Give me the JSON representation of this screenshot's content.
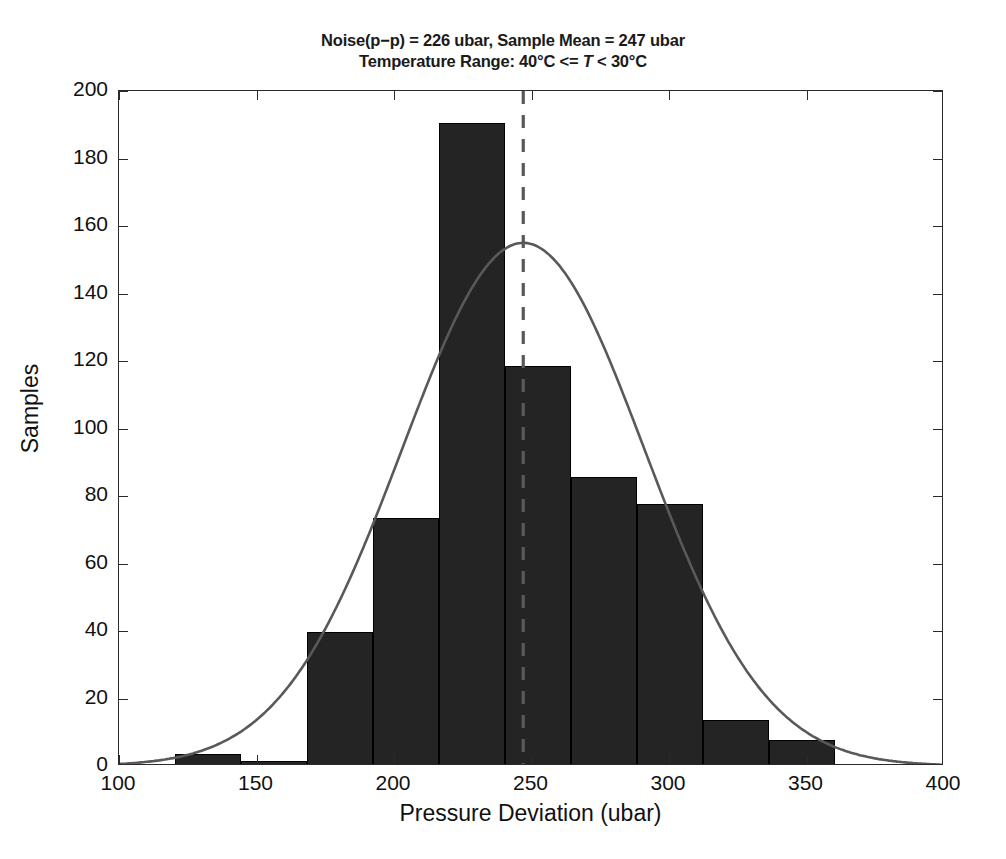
{
  "chart_data": {
    "type": "bar",
    "title": "Noise(p−p) = 226 ubar, Sample Mean = 247 ubar",
    "subtitle_prefix": "Temperature Range: 40°C <= ",
    "subtitle_italic": "T",
    "subtitle_suffix": " < 30°C",
    "xlabel": "Pressure Deviation (ubar)",
    "ylabel": "Samples",
    "xlim": [
      100,
      400
    ],
    "ylim": [
      0,
      200
    ],
    "xticks": [
      100,
      150,
      200,
      250,
      300,
      350,
      400
    ],
    "xtick_labels": [
      "100",
      "150",
      "200",
      "250",
      "300",
      "350",
      "400"
    ],
    "yticks": [
      0,
      20,
      40,
      60,
      80,
      100,
      120,
      140,
      160,
      180,
      200
    ],
    "ytick_labels": [
      "0",
      "20",
      "40",
      "60",
      "80",
      "100",
      "120",
      "140",
      "160",
      "180",
      "200"
    ],
    "grid": false,
    "legend": "none",
    "bin_edges": [
      120.5,
      144.5,
      168.5,
      192.5,
      216.5,
      240.5,
      264.5,
      288.5,
      312.5,
      336.5,
      360.5
    ],
    "bin_centers": [
      132.5,
      156.5,
      180.5,
      204.5,
      228.5,
      252.5,
      276.5,
      300.5,
      324.5,
      348.5
    ],
    "values": [
      3,
      1,
      39,
      73,
      190,
      118,
      85,
      77,
      13,
      7
    ],
    "bar_color": "#242424",
    "bar_edge_color": "#000000",
    "curve_color": "#595959",
    "mean_line_color": "#595959",
    "axis_color": "#2b2b2b",
    "background_color": "#ffffff",
    "annotations": {
      "mean_line_x": 247,
      "mean_line_style": "dashed",
      "fit_curve": {
        "type": "gaussian",
        "amplitude": 155,
        "mean": 247,
        "sigma": 44
      }
    },
    "stats": {
      "noise_pp_ubar": 226,
      "sample_mean_ubar": 247,
      "temperature_range_low_c": 40,
      "temperature_range_high_c": 30
    }
  }
}
